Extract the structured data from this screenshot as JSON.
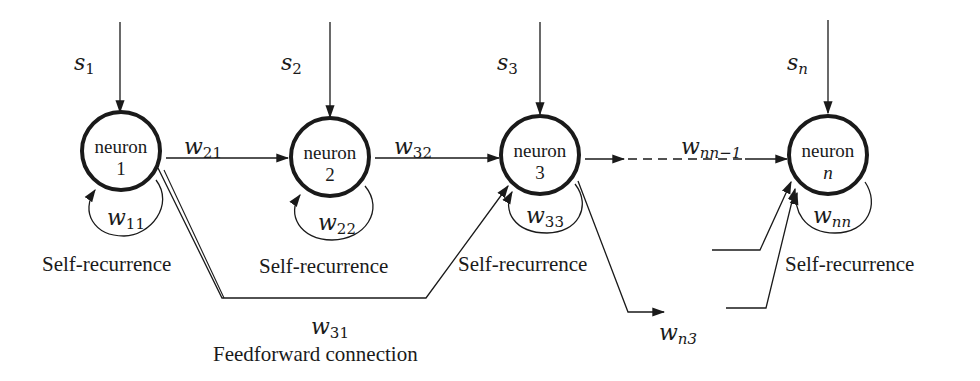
{
  "figure": {
    "neurons": [
      {
        "id": "1",
        "label": "neuron",
        "index": "1",
        "cx": 121,
        "cy": 151,
        "input": {
          "base": "s",
          "sub": "1"
        },
        "self_weight": {
          "base": "w",
          "sub": "11"
        },
        "self_label": "Self-recurrence"
      },
      {
        "id": "2",
        "label": "neuron",
        "index": "2",
        "cx": 330,
        "cy": 157,
        "input": {
          "base": "s",
          "sub": "2"
        },
        "self_weight": {
          "base": "w",
          "sub": "22"
        },
        "self_label": "Self-recurrence"
      },
      {
        "id": "3",
        "label": "neuron",
        "index": "3",
        "cx": 540,
        "cy": 157,
        "input": {
          "base": "s",
          "sub": "3"
        },
        "self_weight": {
          "base": "w",
          "sub": "33"
        },
        "self_label": "Self-recurrence"
      },
      {
        "id": "n",
        "label": "neuron",
        "index": "n",
        "cx": 827,
        "cy": 157,
        "input": {
          "base": "s",
          "sub": "n"
        },
        "self_weight": {
          "base": "w",
          "sub": "nn"
        },
        "self_label": "Self-recurrence"
      }
    ],
    "edges": {
      "w21": {
        "base": "w",
        "sub": "21"
      },
      "w32": {
        "base": "w",
        "sub": "32"
      },
      "wnn1": {
        "base": "w",
        "sub": "nn−1"
      },
      "w31": {
        "base": "w",
        "sub": "31"
      },
      "wn3": {
        "base": "w",
        "sub": "n3"
      }
    },
    "feedforward_caption": "Feedforward connection",
    "colors": {
      "stroke": "#1a1a1a",
      "background": "#ffffff"
    }
  }
}
